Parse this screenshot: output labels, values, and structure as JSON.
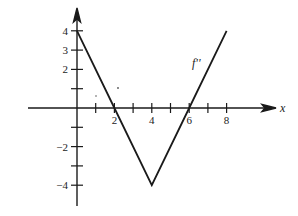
{
  "chart_data": {
    "type": "line",
    "title": "",
    "xlabel": "x",
    "ylabel": "",
    "series": [
      {
        "name": "f''",
        "x": [
          0,
          2,
          4,
          6,
          8
        ],
        "values": [
          4,
          0,
          -4,
          0,
          4
        ]
      }
    ],
    "x_ticks": [
      1,
      2,
      3,
      4,
      5,
      6,
      7,
      8
    ],
    "x_tick_labels": [
      "2",
      "4",
      "6",
      "8"
    ],
    "x_tick_label_values": [
      2,
      4,
      6,
      8
    ],
    "y_ticks": [
      -4,
      -3,
      -2,
      -1,
      1,
      2,
      3,
      4
    ],
    "y_tick_labels": [
      "4",
      "3",
      "2",
      "−2",
      "−4"
    ],
    "y_tick_label_values": [
      4,
      3,
      2,
      -2,
      -4
    ],
    "xlim": [
      -2.4,
      10.5
    ],
    "ylim": [
      -5.2,
      5.2
    ],
    "grid": false,
    "legend": "none",
    "annotations": [
      {
        "text": "f''",
        "x": 6.5,
        "y": 2.4
      }
    ]
  },
  "labels": {
    "curve": "f''",
    "x_axis": "x"
  }
}
